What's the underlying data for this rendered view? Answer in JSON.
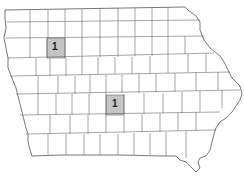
{
  "map": {
    "region": "Iowa counties",
    "highlight_color": "#c4c4c4",
    "line_color": "#6a6a6a",
    "highlighted_counties": [
      {
        "label": "1",
        "x": 47,
        "y": 38,
        "w": 18,
        "h": 20
      },
      {
        "label": "1",
        "x": 106,
        "y": 95,
        "w": 18,
        "h": 20
      }
    ]
  }
}
